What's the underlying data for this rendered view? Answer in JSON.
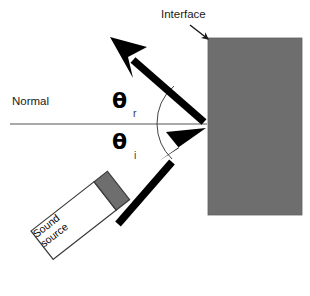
{
  "figure": {
    "type": "diagram",
    "background_color": "#ffffff",
    "width": 310,
    "height": 296
  },
  "labels": {
    "interface": "Interface",
    "normal": "Normal",
    "theta_symbol": "θ",
    "theta_reflected_subscript": "r",
    "theta_incident_subscript": "i",
    "source_line1": "Sound",
    "source_line2": "source",
    "source_text": "Sound\nsource"
  },
  "colors": {
    "block_gray": "#6e6e6e",
    "block_border": "#5c5c5c",
    "ray_black": "#000000",
    "normal_line": "#555555",
    "arc_line": "#444444",
    "text": "#1a1a1a",
    "source_box_fill": "#ffffff",
    "source_box_border": "#3a3a3a",
    "source_head_fill": "#6e6e6e"
  },
  "geometry": {
    "interface_point": [
      207,
      124
    ],
    "block_rect": [
      208,
      38,
      94,
      177
    ],
    "normal_line": [
      10,
      124,
      207,
      124
    ],
    "incident_ray_start": [
      122,
      222
    ],
    "incident_ray_end": [
      205,
      127
    ],
    "reflected_ray_start": [
      205,
      121
    ],
    "reflected_ray_end": [
      112,
      39
    ],
    "interface_pointer_arrow": [
      191,
      26,
      210,
      41
    ],
    "arc_reflected_radius": 50,
    "arc_incident_radius": 50
  }
}
